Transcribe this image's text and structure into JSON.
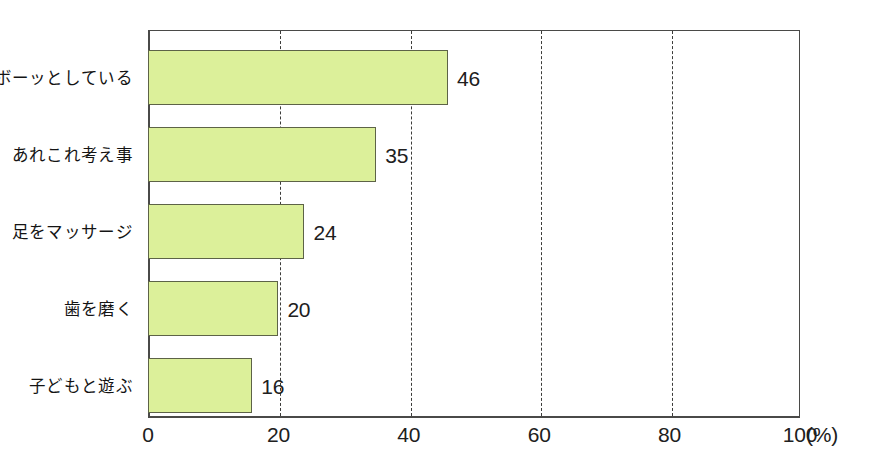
{
  "chart_data": {
    "type": "bar",
    "orientation": "horizontal",
    "title": "",
    "subtitle": "",
    "xlabel": "(%)",
    "ylabel": "",
    "categories": [
      "ボーッとしている",
      "あれこれ考え事",
      "足をマッサージ",
      "歯を磨く",
      "子どもと遊ぶ"
    ],
    "values": [
      46,
      35,
      24,
      20,
      16
    ],
    "value_labels": [
      "46",
      "35",
      "24",
      "20",
      "16"
    ],
    "xlim": [
      0,
      100
    ],
    "xticks": [
      0,
      20,
      40,
      60,
      80,
      100
    ],
    "xtick_labels": [
      "0",
      "20",
      "40",
      "60",
      "80",
      "100"
    ],
    "gridlines": [
      20,
      40,
      60,
      80
    ],
    "grid": true,
    "grid_style": "dashed",
    "legend": null,
    "legend_position": "none",
    "bar_fill_color": "#dcf09a",
    "bar_border_color": "#5d6347",
    "axis_color": "#4a4a48",
    "background_color": "#ffffff",
    "unit_suffix": "(%)"
  },
  "axis": {
    "unit_label": "(%)"
  },
  "caption": {
    "clipped_text": "　　　　　　　　　　　　　　　　　　　　　　　　　"
  }
}
